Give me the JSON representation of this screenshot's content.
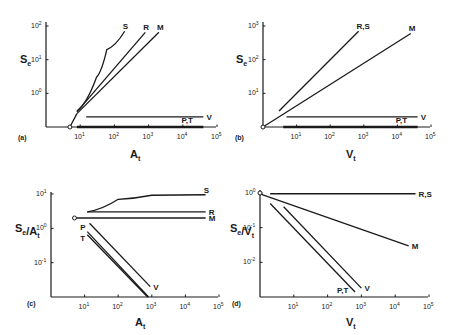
{
  "chart_data": [
    {
      "type": "line",
      "panel_label": "(a)",
      "xlabel": "A_t",
      "ylabel": "S_e",
      "xscale": "log",
      "yscale": "log",
      "xlim": [
        1,
        100000
      ],
      "ylim": [
        0.1,
        100
      ],
      "xticks": [
        {
          "exp": "1",
          "value": 10
        },
        {
          "exp": "2",
          "value": 100
        },
        {
          "exp": "3",
          "value": 1000
        },
        {
          "exp": "4",
          "value": 10000
        },
        {
          "exp": "5",
          "value": 100000
        }
      ],
      "yticks": [
        {
          "exp": "0",
          "value": 1
        },
        {
          "exp": "1",
          "value": 10
        },
        {
          "exp": "2",
          "value": 100
        }
      ],
      "origin_marker": {
        "x": 5,
        "y": 0.1
      },
      "series": [
        {
          "name": "S",
          "label": "S",
          "curve": true,
          "points": [
            [
              8,
              0.3
            ],
            [
              30,
              3
            ],
            [
              60,
              20
            ],
            [
              200,
              70
            ]
          ]
        },
        {
          "name": "R",
          "label": "R",
          "points": [
            [
              8,
              0.28
            ],
            [
              800,
              65
            ]
          ]
        },
        {
          "name": "M",
          "label": "M",
          "points": [
            [
              8,
              0.25
            ],
            [
              2000,
              65
            ]
          ]
        },
        {
          "name": "V",
          "label": "V",
          "points": [
            [
              15,
              0.2
            ],
            [
              40000,
              0.2
            ]
          ]
        },
        {
          "name": "P,T",
          "label": "P,T",
          "thick": true,
          "points": [
            [
              8,
              0.1
            ],
            [
              40000,
              0.1
            ]
          ]
        },
        {
          "name": "origin-link",
          "label": "",
          "points": [
            [
              5,
              0.1
            ],
            [
              8,
              0.25
            ]
          ]
        }
      ]
    },
    {
      "type": "line",
      "panel_label": "(b)",
      "xlabel": "V_t",
      "ylabel": "S_e",
      "xscale": "log",
      "yscale": "log",
      "xlim": [
        1,
        100000
      ],
      "ylim": [
        1,
        1000
      ],
      "xticks": [
        {
          "exp": "1",
          "value": 10
        },
        {
          "exp": "2",
          "value": 100
        },
        {
          "exp": "3",
          "value": 1000
        },
        {
          "exp": "4",
          "value": 10000
        },
        {
          "exp": "5",
          "value": 100000
        }
      ],
      "yticks": [
        {
          "exp": "1",
          "value": 10
        },
        {
          "exp": "2",
          "value": 100
        },
        {
          "exp": "3",
          "value": 1000
        }
      ],
      "origin_marker": {
        "x": 1,
        "y": 1
      },
      "series": [
        {
          "name": "R,S",
          "label": "R,S",
          "points": [
            [
              3,
              3
            ],
            [
              700,
              700
            ]
          ]
        },
        {
          "name": "M",
          "label": "M",
          "points": [
            [
              1,
              1
            ],
            [
              25000,
              600
            ]
          ]
        },
        {
          "name": "V",
          "label": "V",
          "points": [
            [
              5,
              2
            ],
            [
              40000,
              2
            ]
          ]
        },
        {
          "name": "P,T",
          "label": "P,T",
          "thick": true,
          "points": [
            [
              4,
              1
            ],
            [
              40000,
              1
            ]
          ]
        }
      ]
    },
    {
      "type": "line",
      "panel_label": "(c)",
      "xlabel": "A_t",
      "ylabel": "S_e/A_t",
      "xscale": "log",
      "yscale": "log",
      "xlim": [
        1,
        100000
      ],
      "ylim": [
        0.01,
        10
      ],
      "xticks": [
        {
          "exp": "1",
          "value": 10
        },
        {
          "exp": "2",
          "value": 100
        },
        {
          "exp": "3",
          "value": 1000
        },
        {
          "exp": "4",
          "value": 10000
        },
        {
          "exp": "5",
          "value": 100000
        }
      ],
      "yticks": [
        {
          "exp": "-1",
          "value": 0.1
        },
        {
          "exp": "0",
          "value": 1
        },
        {
          "exp": "1",
          "value": 10
        }
      ],
      "origin_marker": {
        "x": 5,
        "y": 2
      },
      "series": [
        {
          "name": "S",
          "label": "S",
          "curve": true,
          "points": [
            [
              12,
              3
            ],
            [
              100,
              7
            ],
            [
              1000,
              9.2
            ],
            [
              40000,
              9.5
            ]
          ]
        },
        {
          "name": "R",
          "label": "R",
          "points": [
            [
              12,
              3
            ],
            [
              40000,
              3
            ]
          ]
        },
        {
          "name": "M",
          "label": "M",
          "points": [
            [
              5,
              2
            ],
            [
              40000,
              2
            ]
          ]
        },
        {
          "name": "V",
          "label": "V",
          "points": [
            [
              14,
              1.4
            ],
            [
              900,
              0.02
            ]
          ]
        },
        {
          "name": "P",
          "label": "P",
          "points": [
            [
              12,
              0.8
            ],
            [
              800,
              0.01
            ]
          ]
        },
        {
          "name": "T",
          "label": "T",
          "points": [
            [
              12,
              0.65
            ],
            [
              750,
              0.01
            ]
          ]
        }
      ]
    },
    {
      "type": "line",
      "panel_label": "(d)",
      "xlabel": "V_t",
      "ylabel": "S_e/V_t",
      "xscale": "log",
      "yscale": "log",
      "xlim": [
        1,
        100000
      ],
      "ylim": [
        0.001,
        1
      ],
      "xticks": [
        {
          "exp": "1",
          "value": 10
        },
        {
          "exp": "2",
          "value": 100
        },
        {
          "exp": "3",
          "value": 1000
        },
        {
          "exp": "4",
          "value": 10000
        },
        {
          "exp": "5",
          "value": 100000
        }
      ],
      "yticks": [
        {
          "exp": "-2",
          "value": 0.01
        },
        {
          "exp": "-1",
          "value": 0.1
        },
        {
          "exp": "0",
          "value": 1
        }
      ],
      "origin_marker": {
        "x": 1,
        "y": 1
      },
      "series": [
        {
          "name": "R,S",
          "label": "R,S",
          "points": [
            [
              2,
              0.95
            ],
            [
              40000,
              0.95
            ]
          ]
        },
        {
          "name": "M",
          "label": "M",
          "points": [
            [
              1,
              0.95
            ],
            [
              25000,
              0.03
            ]
          ]
        },
        {
          "name": "V",
          "label": "V",
          "points": [
            [
              5,
              0.4
            ],
            [
              1000,
              0.0018
            ]
          ]
        },
        {
          "name": "P,T",
          "label": "P,T",
          "points": [
            [
              2,
              0.5
            ],
            [
              650,
              0.0014
            ]
          ]
        }
      ]
    }
  ]
}
